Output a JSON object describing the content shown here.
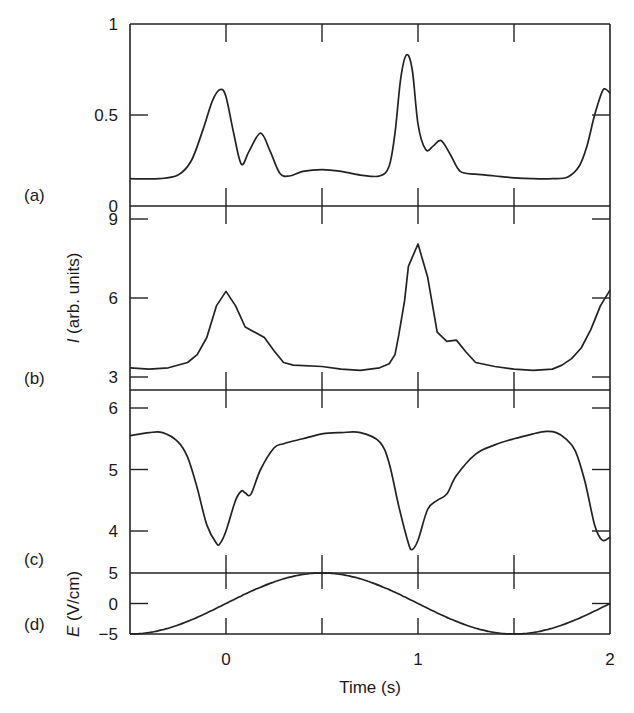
{
  "chart_data": {
    "type": "line",
    "layout": "four vertically stacked panels sharing x-axis",
    "xlabel": "Time (s)",
    "xlim": [
      -0.5,
      2.0
    ],
    "x_ticks": [
      0,
      1,
      2
    ],
    "x_minor_ticks": [
      0,
      0.5,
      1,
      1.5
    ],
    "shared_ylabel": "I (arb. units)",
    "grid": false,
    "legend": null,
    "panels": [
      {
        "label": "(a)",
        "ylim": [
          0,
          1
        ],
        "y_ticks": [
          0,
          0.5,
          1
        ],
        "y_tick_labels": [
          "0",
          "0.5",
          "1"
        ],
        "x": [
          -0.5,
          -0.35,
          -0.25,
          -0.18,
          -0.12,
          -0.07,
          -0.03,
          0.0,
          0.04,
          0.08,
          0.12,
          0.18,
          0.23,
          0.28,
          0.33,
          0.4,
          0.5,
          0.6,
          0.7,
          0.8,
          0.85,
          0.88,
          0.91,
          0.94,
          0.97,
          1.0,
          1.04,
          1.08,
          1.12,
          1.17,
          1.22,
          1.3,
          1.4,
          1.5,
          1.6,
          1.7,
          1.78,
          1.84,
          1.88,
          1.92,
          1.96,
          1.98,
          2.0
        ],
        "y": [
          0.15,
          0.15,
          0.17,
          0.25,
          0.42,
          0.58,
          0.64,
          0.6,
          0.4,
          0.23,
          0.3,
          0.4,
          0.3,
          0.18,
          0.165,
          0.19,
          0.2,
          0.19,
          0.17,
          0.165,
          0.22,
          0.4,
          0.7,
          0.83,
          0.75,
          0.45,
          0.31,
          0.33,
          0.36,
          0.28,
          0.19,
          0.175,
          0.165,
          0.155,
          0.15,
          0.15,
          0.16,
          0.22,
          0.33,
          0.5,
          0.63,
          0.64,
          0.62
        ]
      },
      {
        "label": "(b)",
        "ylim": [
          2.5,
          9.45
        ],
        "y_ticks": [
          3,
          6,
          9
        ],
        "y_tick_labels": [
          "3",
          "6",
          "9"
        ],
        "x": [
          -0.5,
          -0.4,
          -0.3,
          -0.2,
          -0.15,
          -0.1,
          -0.05,
          0.0,
          0.05,
          0.1,
          0.2,
          0.25,
          0.3,
          0.35,
          0.5,
          0.6,
          0.7,
          0.8,
          0.85,
          0.88,
          0.9,
          0.93,
          0.95,
          1.0,
          1.05,
          1.1,
          1.15,
          1.2,
          1.25,
          1.3,
          1.4,
          1.5,
          1.6,
          1.7,
          1.75,
          1.8,
          1.85,
          1.9,
          1.95,
          2.0
        ],
        "y": [
          3.35,
          3.3,
          3.35,
          3.55,
          3.85,
          4.5,
          5.7,
          6.25,
          5.7,
          4.9,
          4.5,
          4.0,
          3.55,
          3.45,
          3.4,
          3.3,
          3.25,
          3.35,
          3.5,
          3.85,
          4.6,
          5.9,
          7.2,
          8.05,
          6.8,
          4.7,
          4.35,
          4.4,
          3.95,
          3.55,
          3.4,
          3.3,
          3.25,
          3.3,
          3.45,
          3.7,
          4.1,
          4.8,
          5.7,
          6.3
        ]
      },
      {
        "label": "(c)",
        "ylim": [
          3.3,
          6.3
        ],
        "y_ticks": [
          4,
          5,
          6
        ],
        "y_tick_labels": [
          "4",
          "5",
          "6"
        ],
        "x": [
          -0.5,
          -0.4,
          -0.33,
          -0.25,
          -0.2,
          -0.15,
          -0.1,
          -0.05,
          -0.03,
          0.0,
          0.05,
          0.08,
          0.1,
          0.13,
          0.18,
          0.25,
          0.3,
          0.4,
          0.5,
          0.6,
          0.7,
          0.8,
          0.85,
          0.9,
          0.95,
          0.97,
          1.0,
          1.05,
          1.1,
          1.15,
          1.2,
          1.3,
          1.4,
          1.5,
          1.6,
          1.67,
          1.72,
          1.77,
          1.82,
          1.87,
          1.92,
          1.96,
          2.0
        ],
        "y": [
          5.55,
          5.6,
          5.6,
          5.45,
          5.2,
          4.7,
          4.1,
          3.8,
          3.8,
          4.0,
          4.5,
          4.65,
          4.62,
          4.6,
          5.0,
          5.35,
          5.42,
          5.5,
          5.58,
          5.6,
          5.6,
          5.45,
          5.1,
          4.4,
          3.8,
          3.7,
          3.85,
          4.35,
          4.5,
          4.6,
          4.9,
          5.25,
          5.4,
          5.5,
          5.58,
          5.62,
          5.6,
          5.5,
          5.3,
          4.8,
          4.1,
          3.85,
          3.9
        ]
      },
      {
        "label": "(d)",
        "ylabel": "E (V/cm)",
        "ylim": [
          -5,
          5
        ],
        "y_ticks": [
          -5,
          0,
          5
        ],
        "y_tick_labels": [
          "−5",
          "0",
          "5"
        ],
        "function": "E = 5 sin(pi t)",
        "x": [
          -0.5,
          -0.25,
          0,
          0.25,
          0.5,
          0.75,
          1.0,
          1.25,
          1.5,
          1.75,
          2.0
        ],
        "y": [
          -5,
          -3.54,
          0,
          3.54,
          5,
          3.54,
          0,
          -3.54,
          -5,
          -3.54,
          0
        ]
      }
    ]
  },
  "labels": {
    "panel_a": "(a)",
    "panel_b": "(b)",
    "panel_c": "(c)",
    "panel_d": "(d)",
    "ylabel_I_italic": "I",
    "ylabel_I_rest": " (arb. units)",
    "ylabel_E_italic": "E",
    "ylabel_E_rest": " (V/cm)",
    "xlabel": "Time (s)",
    "xtick_0": "0",
    "xtick_1": "1",
    "xtick_2": "2"
  },
  "colors": {
    "line": "#222222",
    "axis": "#222222",
    "background": "#ffffff"
  }
}
